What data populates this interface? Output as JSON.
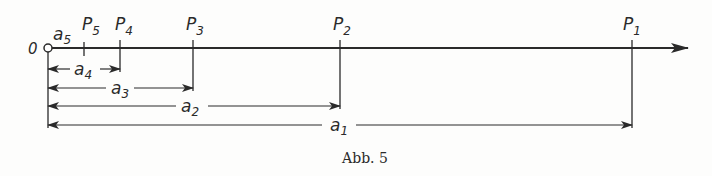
{
  "figure": {
    "caption": "Abb. 5",
    "origin_label": "0",
    "points": [
      {
        "name": "P5",
        "label": "P",
        "sub": "5",
        "x": 84
      },
      {
        "name": "P4",
        "label": "P",
        "sub": "4",
        "x": 120
      },
      {
        "name": "P3",
        "label": "P",
        "sub": "3",
        "x": 193
      },
      {
        "name": "P2",
        "label": "P",
        "sub": "2",
        "x": 340
      },
      {
        "name": "P1",
        "label": "P",
        "sub": "1",
        "x": 632
      }
    ],
    "distances": [
      {
        "name": "a5",
        "label": "a",
        "sub": "5"
      },
      {
        "name": "a4",
        "label": "a",
        "sub": "4",
        "to": "P4"
      },
      {
        "name": "a3",
        "label": "a",
        "sub": "3",
        "to": "P3"
      },
      {
        "name": "a2",
        "label": "a",
        "sub": "2",
        "to": "P2"
      },
      {
        "name": "a1",
        "label": "a",
        "sub": "1",
        "to": "P1"
      }
    ],
    "colors": {
      "ink": "#2a2a2a",
      "paper": "#fdfdfc"
    }
  }
}
